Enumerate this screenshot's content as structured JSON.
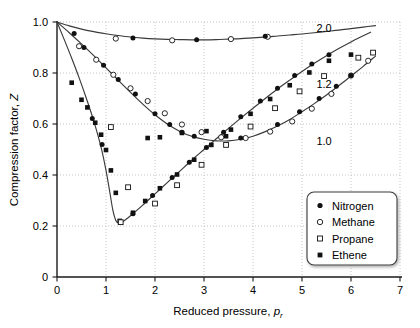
{
  "chart_data": {
    "type": "scatter",
    "title": "",
    "xlabel": "Reduced pressure, p_r",
    "xlabel_main": "Reduced pressure, ",
    "xlabel_var": "p",
    "xlabel_sub": "r",
    "ylabel": "Compression factor, Z",
    "ylabel_main": "Compression factor, ",
    "ylabel_var": "Z",
    "xlim": [
      0,
      7
    ],
    "ylim": [
      0,
      1.0
    ],
    "xticks": [
      "0",
      "1",
      "2",
      "3",
      "4",
      "5",
      "6",
      "7"
    ],
    "xtick_values": [
      0,
      1,
      2,
      3,
      4,
      5,
      6,
      7
    ],
    "yticks": [
      "0",
      "0.2",
      "0.4",
      "0.6",
      "0.8",
      "1.0"
    ],
    "ytick_values": [
      0,
      0.2,
      0.4,
      0.6,
      0.8,
      1.0
    ],
    "grid": true,
    "grid_style": "dotted",
    "grid_color": "#b8b8b8",
    "axis_color": "#1a1a1a",
    "curve_color": "#3a3a3a",
    "legend_position": "lower-right",
    "curve_labels": [
      {
        "text": "2.0",
        "x": 5.45,
        "y": 0.975,
        "name": "isotherm-label-2-0"
      },
      {
        "text": "1.2",
        "x": 5.45,
        "y": 0.755,
        "name": "isotherm-label-1-2"
      },
      {
        "text": "1.0",
        "x": 5.45,
        "y": 0.535,
        "name": "isotherm-label-1-0"
      }
    ],
    "series": [
      {
        "name": "Tr = 2.0",
        "label": "2.0",
        "curve": [
          [
            0.0,
            1.0
          ],
          [
            0.25,
            0.985
          ],
          [
            0.5,
            0.972
          ],
          [
            0.75,
            0.962
          ],
          [
            1.0,
            0.954
          ],
          [
            1.25,
            0.947
          ],
          [
            1.5,
            0.941
          ],
          [
            1.75,
            0.937
          ],
          [
            2.0,
            0.934
          ],
          [
            2.25,
            0.932
          ],
          [
            2.5,
            0.931
          ],
          [
            2.75,
            0.93
          ],
          [
            3.0,
            0.93
          ],
          [
            3.25,
            0.931
          ],
          [
            3.5,
            0.933
          ],
          [
            3.75,
            0.935
          ],
          [
            4.0,
            0.938
          ],
          [
            4.25,
            0.941
          ],
          [
            4.5,
            0.945
          ],
          [
            4.75,
            0.949
          ],
          [
            5.0,
            0.953
          ],
          [
            5.25,
            0.958
          ],
          [
            5.5,
            0.963
          ],
          [
            5.75,
            0.968
          ],
          [
            6.0,
            0.974
          ],
          [
            6.25,
            0.98
          ],
          [
            6.5,
            0.986
          ]
        ]
      },
      {
        "name": "Tr = 1.2",
        "label": "1.2",
        "curve": [
          [
            0.0,
            1.0
          ],
          [
            0.25,
            0.958
          ],
          [
            0.5,
            0.914
          ],
          [
            0.75,
            0.868
          ],
          [
            1.0,
            0.82
          ],
          [
            1.25,
            0.772
          ],
          [
            1.5,
            0.724
          ],
          [
            1.75,
            0.678
          ],
          [
            2.0,
            0.636
          ],
          [
            2.25,
            0.6
          ],
          [
            2.5,
            0.572
          ],
          [
            2.75,
            0.552
          ],
          [
            3.0,
            0.54
          ],
          [
            3.25,
            0.534
          ],
          [
            3.5,
            0.534
          ],
          [
            3.75,
            0.54
          ],
          [
            4.0,
            0.552
          ],
          [
            4.25,
            0.57
          ],
          [
            4.5,
            0.592
          ],
          [
            4.75,
            0.618
          ],
          [
            5.0,
            0.648
          ],
          [
            5.25,
            0.68
          ],
          [
            5.5,
            0.714
          ],
          [
            5.75,
            0.75
          ],
          [
            6.0,
            0.788
          ],
          [
            6.25,
            0.826
          ],
          [
            6.5,
            0.866
          ]
        ]
      },
      {
        "name": "Tr = 1.0",
        "label": "1.0",
        "curve": [
          [
            0.0,
            1.0
          ],
          [
            0.15,
            0.93
          ],
          [
            0.3,
            0.858
          ],
          [
            0.45,
            0.782
          ],
          [
            0.6,
            0.7
          ],
          [
            0.75,
            0.612
          ],
          [
            0.9,
            0.508
          ],
          [
            1.0,
            0.418
          ],
          [
            1.08,
            0.33
          ],
          [
            1.14,
            0.262
          ],
          [
            1.2,
            0.222
          ],
          [
            1.26,
            0.212
          ],
          [
            1.35,
            0.218
          ],
          [
            1.5,
            0.24
          ],
          [
            1.75,
            0.282
          ],
          [
            2.0,
            0.326
          ],
          [
            2.25,
            0.37
          ],
          [
            2.5,
            0.414
          ],
          [
            2.75,
            0.458
          ],
          [
            3.0,
            0.5
          ],
          [
            3.25,
            0.542
          ],
          [
            3.5,
            0.583
          ],
          [
            3.75,
            0.623
          ],
          [
            4.0,
            0.662
          ],
          [
            4.25,
            0.7
          ],
          [
            4.5,
            0.737
          ],
          [
            4.75,
            0.772
          ],
          [
            5.0,
            0.806
          ],
          [
            5.25,
            0.838
          ],
          [
            5.5,
            0.868
          ],
          [
            5.75,
            0.896
          ],
          [
            6.0,
            0.922
          ],
          [
            6.25,
            0.946
          ],
          [
            6.4,
            0.96
          ]
        ]
      }
    ],
    "points": {
      "nitrogen": [
        [
          0.35,
          0.955
        ],
        [
          1.55,
          0.937
        ],
        [
          2.85,
          0.93
        ],
        [
          4.25,
          0.944
        ],
        [
          0.55,
          0.9
        ],
        [
          0.95,
          0.83
        ],
        [
          1.25,
          0.775
        ],
        [
          1.6,
          0.718
        ],
        [
          2.0,
          0.64
        ],
        [
          2.3,
          0.598
        ],
        [
          2.55,
          0.568
        ],
        [
          2.8,
          0.552
        ],
        [
          3.75,
          0.545
        ],
        [
          4.5,
          0.598
        ],
        [
          4.95,
          0.648
        ],
        [
          5.35,
          0.7
        ],
        [
          5.7,
          0.748
        ],
        [
          6.0,
          0.79
        ],
        [
          1.55,
          0.248
        ],
        [
          1.95,
          0.32
        ],
        [
          2.35,
          0.39
        ],
        [
          2.7,
          0.45
        ],
        [
          3.05,
          0.508
        ],
        [
          3.4,
          0.568
        ],
        [
          3.75,
          0.628
        ],
        [
          4.15,
          0.69
        ],
        [
          4.5,
          0.74
        ],
        [
          4.85,
          0.79
        ],
        [
          5.2,
          0.835
        ],
        [
          5.55,
          0.872
        ],
        [
          0.72,
          0.622
        ],
        [
          0.92,
          0.52
        ]
      ],
      "methane": [
        [
          1.2,
          0.935
        ],
        [
          2.35,
          0.928
        ],
        [
          3.55,
          0.933
        ],
        [
          4.3,
          0.942
        ],
        [
          0.45,
          0.905
        ],
        [
          0.8,
          0.852
        ],
        [
          1.15,
          0.793
        ],
        [
          1.5,
          0.74
        ],
        [
          1.85,
          0.69
        ],
        [
          2.2,
          0.642
        ],
        [
          2.55,
          0.598
        ],
        [
          2.95,
          0.568
        ],
        [
          3.35,
          0.548
        ],
        [
          3.85,
          0.545
        ],
        [
          4.35,
          0.57
        ],
        [
          4.8,
          0.61
        ],
        [
          5.2,
          0.66
        ],
        [
          5.6,
          0.718
        ],
        [
          6.0,
          0.79
        ],
        [
          6.35,
          0.848
        ]
      ],
      "propane": [
        [
          1.1,
          0.588
        ],
        [
          1.45,
          0.352
        ],
        [
          2.0,
          0.288
        ],
        [
          2.45,
          0.36
        ],
        [
          2.95,
          0.44
        ],
        [
          3.45,
          0.518
        ],
        [
          3.95,
          0.59
        ],
        [
          4.45,
          0.662
        ],
        [
          4.95,
          0.728
        ],
        [
          5.45,
          0.788
        ],
        [
          6.15,
          0.86
        ],
        [
          6.45,
          0.88
        ],
        [
          1.3,
          0.215
        ]
      ],
      "ethene": [
        [
          0.3,
          0.762
        ],
        [
          0.5,
          0.695
        ],
        [
          0.62,
          0.665
        ],
        [
          0.78,
          0.605
        ],
        [
          0.9,
          0.558
        ],
        [
          1.0,
          0.498
        ],
        [
          1.1,
          0.418
        ],
        [
          1.2,
          0.33
        ],
        [
          1.28,
          0.22
        ],
        [
          1.55,
          0.252
        ],
        [
          1.8,
          0.298
        ],
        [
          2.1,
          0.348
        ],
        [
          2.45,
          0.402
        ],
        [
          2.8,
          0.46
        ],
        [
          3.15,
          0.518
        ],
        [
          3.55,
          0.578
        ],
        [
          3.95,
          0.64
        ],
        [
          4.35,
          0.698
        ],
        [
          4.75,
          0.752
        ],
        [
          5.15,
          0.802
        ],
        [
          5.55,
          0.848
        ],
        [
          1.85,
          0.545
        ],
        [
          2.1,
          0.548
        ],
        [
          2.55,
          0.565
        ],
        [
          3.05,
          0.572
        ],
        [
          3.45,
          0.552
        ],
        [
          6.0,
          0.872
        ]
      ]
    },
    "legend": {
      "items": [
        {
          "label": "Nitrogen",
          "marker": "filled-circle",
          "name": "legend-item-nitrogen"
        },
        {
          "label": "Methane",
          "marker": "open-circle",
          "name": "legend-item-methane"
        },
        {
          "label": "Propane",
          "marker": "open-square",
          "name": "legend-item-propane"
        },
        {
          "label": "Ethene",
          "marker": "filled-square",
          "name": "legend-item-ethene"
        }
      ]
    }
  }
}
